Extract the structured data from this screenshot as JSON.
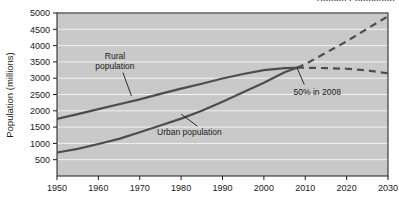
{
  "page": {
    "top_cut_text": "Human Population"
  },
  "chart_data": {
    "type": "line",
    "title": "",
    "xlabel": "",
    "ylabel": "Population (millions)",
    "xlim": [
      1950,
      2030
    ],
    "ylim": [
      0,
      5000
    ],
    "xticks": [
      1950,
      1960,
      1970,
      1980,
      1990,
      2000,
      2010,
      2020,
      2030
    ],
    "yticks": [
      500,
      1000,
      1500,
      2000,
      2500,
      3000,
      3500,
      4000,
      4500,
      5000
    ],
    "grid": "horizontal",
    "legend": "none",
    "plot_background": "#c9c9c9",
    "gridline_color": "#f2f2f2",
    "line_color": "#4d4d4d",
    "projection_start_year": 2008,
    "x": [
      1950,
      1955,
      1960,
      1965,
      1970,
      1975,
      1980,
      1985,
      1990,
      1995,
      2000,
      2005,
      2008,
      2010,
      2015,
      2020,
      2025,
      2030
    ],
    "series": [
      {
        "name": "Rural population",
        "values": [
          1750,
          1900,
          2050,
          2200,
          2350,
          2520,
          2680,
          2830,
          2990,
          3130,
          3250,
          3310,
          3320,
          3320,
          3310,
          3290,
          3240,
          3150
        ],
        "label_text": "Rural population",
        "label_x": 1964,
        "label_y": 3600
      },
      {
        "name": "Urban population",
        "values": [
          720,
          830,
          980,
          1140,
          1340,
          1550,
          1760,
          2000,
          2280,
          2570,
          2860,
          3180,
          3320,
          3430,
          3780,
          4130,
          4520,
          4900
        ],
        "label_text": "Urban population",
        "label_x": 1982,
        "label_y": 1250
      }
    ],
    "annotations": [
      {
        "text": "50% in 2008",
        "x": 2008,
        "y": 3320,
        "label_x": 2010,
        "label_y": 2500
      }
    ]
  },
  "axis": {
    "y_title": "Population (millions)"
  }
}
